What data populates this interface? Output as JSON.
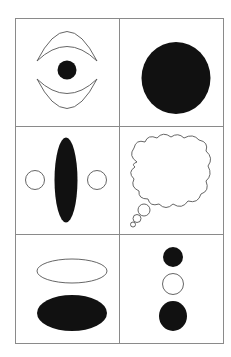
{
  "figure": {
    "layout": "3x2 grid of panels",
    "colors": {
      "background": "#ffffff",
      "grid_line": "#8a8a8a",
      "fill": "#111111",
      "stroke": "#555555"
    },
    "panels": [
      {
        "id": "eye",
        "description": "Two crescents (upper and lower) with a small filled dot between"
      },
      {
        "id": "big-circle",
        "description": "Large filled black circle"
      },
      {
        "id": "ellipse-with-circles",
        "description": "Tall filled vertical ellipse flanked by two small outlined circles"
      },
      {
        "id": "thought-bubble",
        "description": "Outlined cloud-shaped thought bubble with three trailing small circles"
      },
      {
        "id": "two-ellipses",
        "description": "Outlined horizontal ellipse above a filled horizontal ellipse"
      },
      {
        "id": "three-circles",
        "description": "Vertical stack: small filled circle, outlined circle, larger filled circle"
      }
    ]
  }
}
